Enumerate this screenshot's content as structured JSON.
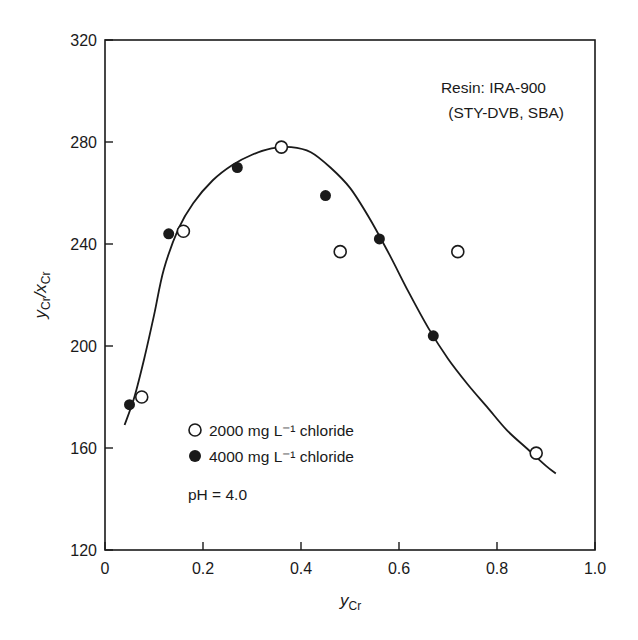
{
  "chart_data": {
    "type": "scatter",
    "title": "",
    "xlabel": "y_Cr",
    "ylabel": "y_Cr/x_Cr",
    "xlim": [
      0,
      1.0
    ],
    "ylim": [
      120,
      320
    ],
    "x_ticks": [
      "0",
      "0.2",
      "0.4",
      "0.6",
      "0.8",
      "1.0"
    ],
    "y_ticks": [
      "120",
      "160",
      "200",
      "240",
      "280",
      "320"
    ],
    "grid": false,
    "annotations": {
      "resin_line1": "Resin: IRA-900",
      "resin_line2": "(STY-DVB, SBA)",
      "ph": "pH = 4.0"
    },
    "legend": {
      "position": "lower-left inside",
      "entries": [
        {
          "marker": "open-circle",
          "label": "2000 mg L⁻¹ chloride"
        },
        {
          "marker": "filled-circle",
          "label": "4000 mg L⁻¹ chloride"
        }
      ]
    },
    "series": [
      {
        "name": "2000 mg L-1 chloride",
        "marker": "open-circle",
        "x": [
          0.075,
          0.16,
          0.36,
          0.48,
          0.72,
          0.88
        ],
        "y": [
          180,
          245,
          278,
          237,
          237,
          158
        ]
      },
      {
        "name": "4000 mg L-1 chloride",
        "marker": "filled-circle",
        "x": [
          0.05,
          0.13,
          0.27,
          0.45,
          0.56,
          0.67
        ],
        "y": [
          177,
          244,
          270,
          259,
          242,
          204
        ]
      },
      {
        "name": "fitted curve",
        "marker": "line",
        "x": [
          0.04,
          0.06,
          0.08,
          0.1,
          0.12,
          0.15,
          0.18,
          0.22,
          0.26,
          0.3,
          0.34,
          0.38,
          0.42,
          0.46,
          0.5,
          0.54,
          0.58,
          0.62,
          0.66,
          0.7,
          0.74,
          0.78,
          0.82,
          0.86,
          0.9,
          0.92
        ],
        "y": [
          169,
          180,
          195,
          212,
          230,
          246,
          256,
          265,
          271,
          275,
          277.5,
          278,
          276,
          270,
          262,
          250,
          236,
          221,
          207,
          195,
          185,
          176,
          167,
          160,
          153,
          150
        ]
      }
    ]
  }
}
